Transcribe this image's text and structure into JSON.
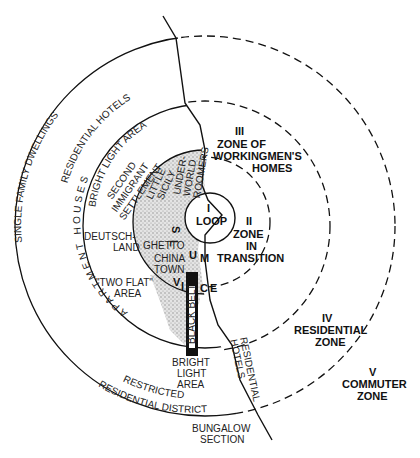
{
  "diagram": {
    "zones": [
      {
        "numeral": "I",
        "name": "LOOP"
      },
      {
        "numeral": "II",
        "name_lines": [
          "ZONE",
          "IN",
          "TRANSITION"
        ]
      },
      {
        "numeral": "III",
        "name_lines": [
          "ZONE OF",
          "WORKINGMEN'S",
          "HOMES"
        ]
      },
      {
        "numeral": "IV",
        "name_lines": [
          "RESIDENTIAL",
          "ZONE"
        ]
      },
      {
        "numeral": "V",
        "name_lines": [
          "COMMUTER",
          "ZONE"
        ]
      }
    ],
    "arc_labels": {
      "single_family": "SINGLE FAMILY DWELLINGS",
      "residential_hotels": "RESIDENTIAL HOTELS",
      "bright_light": "BRIGHT LIGHT AREA",
      "apartment_houses": "APARTMENT HOUSES",
      "restricted": "RESTRICTED",
      "residential_district": "RESIDENTIAL DISTRICT"
    },
    "area_labels": {
      "second_immigrant": [
        "SECOND",
        "IMMIGRANT",
        "SETTLEMENT"
      ],
      "little_sicily": [
        "LITTLE",
        "SICILY"
      ],
      "underworld": [
        "UNDER-",
        "WORLD"
      ],
      "roomers": "ROOMERS",
      "deutschland": [
        "DEUTSCH-",
        "LAND"
      ],
      "ghetto": "GHETTO",
      "chinatown": [
        "CHINA",
        "TOWN"
      ],
      "two_flat": [
        "\"TWO FLAT\"",
        "AREA"
      ],
      "black_belt": "BLACK BELT",
      "bright_light_bottom": [
        "BRIGHT",
        "LIGHT",
        "AREA"
      ],
      "residential_hotels_right": [
        "RESIDENTIAL",
        "HOTELS"
      ],
      "bungalow": [
        "BUNGALOW",
        "SECTION"
      ],
      "slum_letters": [
        "S",
        "L",
        "U",
        "M"
      ],
      "vice_letters": [
        "V",
        "I",
        "C",
        "E"
      ]
    },
    "colors": {
      "ink": "#111111",
      "stipple": "#bdbdbd",
      "paper": "#ffffff"
    }
  }
}
